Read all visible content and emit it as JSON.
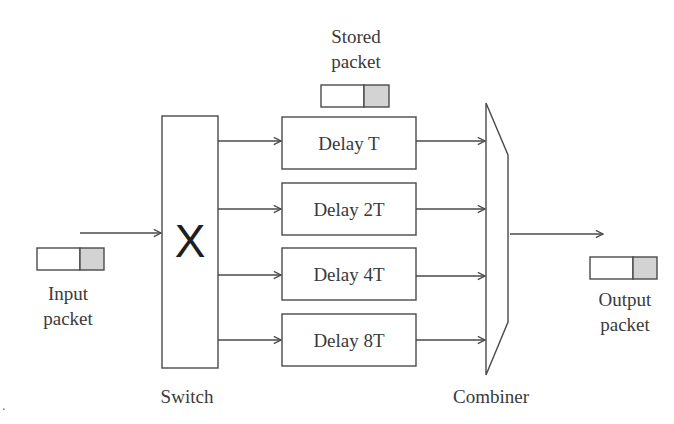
{
  "diagram": {
    "colors": {
      "line": "#4a4a4a",
      "packet_header": "#d3d3d3",
      "text": "#3a3a3a"
    },
    "input_packet": {
      "label_line1": "Input",
      "label_line2": "packet"
    },
    "switch": {
      "symbol": "X",
      "label": "Switch"
    },
    "stored_packet": {
      "label_line1": "Stored",
      "label_line2": "packet"
    },
    "delay_lines": [
      {
        "label": "Delay T"
      },
      {
        "label": "Delay 2T"
      },
      {
        "label": "Delay 4T"
      },
      {
        "label": "Delay 8T"
      }
    ],
    "combiner": {
      "label": "Combiner"
    },
    "output_packet": {
      "label_line1": "Output",
      "label_line2": "packet"
    },
    "stray_mark": "."
  }
}
